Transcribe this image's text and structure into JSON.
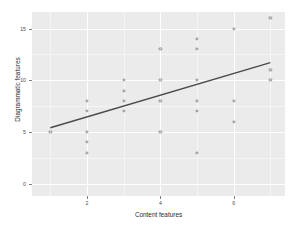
{
  "chart_data": {
    "type": "scatter",
    "title": "",
    "subtitle": "",
    "xlabel": "Content features",
    "ylabel": "Diagrammatic features",
    "xlim": [
      0.5,
      7.4
    ],
    "ylim": [
      -1.2,
      16.6
    ],
    "xticks": [
      2,
      4,
      6
    ],
    "xtick_labels": [
      "2",
      "4",
      "6"
    ],
    "yticks": [
      0,
      5,
      10,
      15
    ],
    "ytick_labels": [
      "0",
      "5",
      "10",
      "15"
    ],
    "grid": true,
    "grid_color": "#ffffff",
    "panel_color": "#ebebeb",
    "legend": "none",
    "point_marker": "open-circle",
    "point_color": "#8d8d8d",
    "points": [
      {
        "x": 1,
        "y": 5
      },
      {
        "x": 2,
        "y": 3
      },
      {
        "x": 2,
        "y": 4
      },
      {
        "x": 2,
        "y": 5
      },
      {
        "x": 2,
        "y": 7
      },
      {
        "x": 2,
        "y": 8
      },
      {
        "x": 3,
        "y": 7
      },
      {
        "x": 3,
        "y": 8
      },
      {
        "x": 3,
        "y": 9
      },
      {
        "x": 3,
        "y": 10
      },
      {
        "x": 4,
        "y": 5
      },
      {
        "x": 4,
        "y": 8
      },
      {
        "x": 4,
        "y": 10
      },
      {
        "x": 4,
        "y": 13
      },
      {
        "x": 5,
        "y": 3
      },
      {
        "x": 5,
        "y": 7
      },
      {
        "x": 5,
        "y": 8
      },
      {
        "x": 5,
        "y": 10
      },
      {
        "x": 5,
        "y": 13
      },
      {
        "x": 5,
        "y": 14
      },
      {
        "x": 6,
        "y": 6
      },
      {
        "x": 6,
        "y": 8
      },
      {
        "x": 6,
        "y": 15
      },
      {
        "x": 7,
        "y": 10
      },
      {
        "x": 7,
        "y": 11
      },
      {
        "x": 7,
        "y": 16
      }
    ],
    "fit_line": {
      "name": "linear fit",
      "color": "#4a4a4a",
      "x_start": 1,
      "y_start": 5.4,
      "x_end": 7,
      "y_end": 11.7,
      "slope": 1.05,
      "intercept": 4.35
    }
  }
}
